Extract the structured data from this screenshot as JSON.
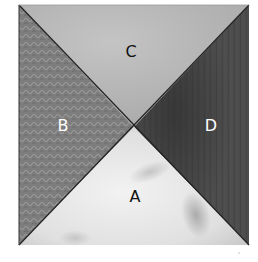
{
  "diagram": {
    "pieces": [
      {
        "id": "A",
        "label": "A",
        "position": "bottom",
        "fill": "#e6e6e6",
        "label_color": "#111111"
      },
      {
        "id": "B",
        "label": "B",
        "position": "left",
        "fill": "#7a7a7a",
        "label_color": "#ffffff"
      },
      {
        "id": "C",
        "label": "C",
        "position": "top",
        "fill": "#b8b8b8",
        "label_color": "#111111"
      },
      {
        "id": "D",
        "label": "D",
        "position": "right",
        "fill": "#4a4a4a",
        "label_color": "#ffffff"
      }
    ],
    "seam_color": "#222222"
  }
}
